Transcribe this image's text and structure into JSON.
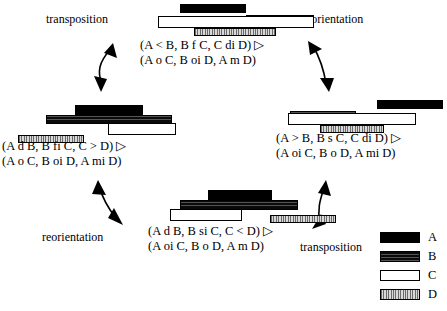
{
  "diagram": {
    "colors": {
      "A": "#000000",
      "B": "#0a0a0a",
      "C": "#ffffff",
      "D": "#b9b9b9",
      "stroke": "#000000",
      "background": "#ffffff"
    },
    "operations": [
      {
        "name": "transposition-top-left",
        "label": "transposition"
      },
      {
        "name": "reorientation-top-right",
        "label": "reorientation"
      },
      {
        "name": "reorientation-bottom-left",
        "label": "reorientation"
      },
      {
        "name": "transposition-bottom-right",
        "label": "transposition"
      }
    ],
    "nodes": [
      {
        "name": "node-top",
        "line1": "(A < B, B f C, C di D) ▷",
        "line2": "(A o C, B oi D, A m D)",
        "bars": [
          {
            "id": "A",
            "x": 22,
            "y": 0,
            "w": 66,
            "h": 9
          },
          {
            "id": "B",
            "x": 88,
            "y": 11,
            "w": 68,
            "h": 9
          },
          {
            "id": "C",
            "x": 0,
            "y": 12,
            "w": 156,
            "h": 12
          },
          {
            "id": "D",
            "x": 36,
            "y": 24,
            "w": 82,
            "h": 8
          }
        ]
      },
      {
        "name": "node-left",
        "line1": "(A d B, B fi C, C > D) ▷",
        "line2": "(A o C, B oi D, A mi D)",
        "bars": [
          {
            "id": "A",
            "x": 57,
            "y": 0,
            "w": 68,
            "h": 11
          },
          {
            "id": "B",
            "x": 28,
            "y": 10,
            "w": 126,
            "h": 9
          },
          {
            "id": "C",
            "x": 90,
            "y": 18,
            "w": 68,
            "h": 12
          },
          {
            "id": "D",
            "x": 0,
            "y": 30,
            "w": 66,
            "h": 8
          }
        ]
      },
      {
        "name": "node-right",
        "line1": "(A > B, B s C, C di D) ▷",
        "line2": "(A oi C, B o D, A mi D)",
        "bars": [
          {
            "id": "A",
            "x": 93,
            "y": 0,
            "w": 66,
            "h": 9
          },
          {
            "id": "B",
            "x": 6,
            "y": 11,
            "w": 66,
            "h": 9
          },
          {
            "id": "C",
            "x": 4,
            "y": 13,
            "w": 128,
            "h": 12
          },
          {
            "id": "D",
            "x": 36,
            "y": 25,
            "w": 64,
            "h": 8
          }
        ]
      },
      {
        "name": "node-bottom",
        "line1": "(A d B, B si C, C < D) ▷",
        "line2": "(A oi C, B o D, A m D)",
        "bars": [
          {
            "id": "A",
            "x": 38,
            "y": 0,
            "w": 64,
            "h": 10
          },
          {
            "id": "B",
            "x": 10,
            "y": 10,
            "w": 118,
            "h": 10
          },
          {
            "id": "C",
            "x": 0,
            "y": 19,
            "w": 72,
            "h": 12
          },
          {
            "id": "D",
            "x": 100,
            "y": 25,
            "w": 66,
            "h": 8
          }
        ]
      }
    ],
    "legend": {
      "name": "interval-legend",
      "items": [
        {
          "id": "A",
          "label": "A"
        },
        {
          "id": "B",
          "label": "B"
        },
        {
          "id": "C",
          "label": "C"
        },
        {
          "id": "D",
          "label": "D"
        }
      ]
    }
  }
}
